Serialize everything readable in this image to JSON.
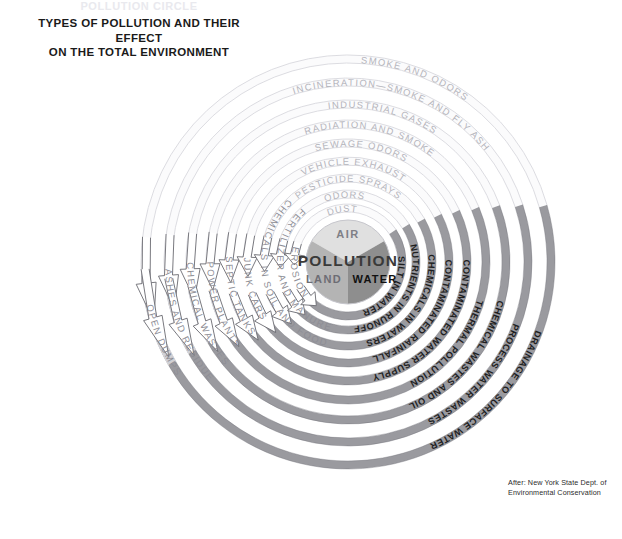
{
  "title": {
    "supertitle": "POLLUTION CIRCLE",
    "line1": "TYPES OF POLLUTION AND THEIR EFFECT",
    "line2": "ON THE TOTAL ENVIRONMENT"
  },
  "credit": {
    "line1": "After: New York State Dept. of",
    "line2": "Environmental Conservation"
  },
  "core": {
    "center_label": "POLLUTION",
    "air": "AIR",
    "land": "LAND",
    "water": "WATER",
    "air_color": "#e0e0e0",
    "land_color": "#b4b4b4",
    "water_color": "#8e8e8e"
  },
  "colors": {
    "ring_light_fill": "#fbfbfc",
    "ring_light_stroke": "#d8d8de",
    "ring_mid_fill": "#d0d0d4",
    "ring_dark_fill": "#9a9a9f",
    "ring_dark_stroke": "#6f6f75",
    "arrow_stroke": "#6a6a70",
    "arrow_fill": "#ffffff",
    "background": "#ffffff"
  },
  "diagram": {
    "center_x": 348,
    "center_y": 262,
    "core_radius": 42,
    "type": "concentric-ring-cycle",
    "rings_air": [
      {
        "index": 1,
        "label": "DUST",
        "radius": 54,
        "tone": "light"
      },
      {
        "index": 2,
        "label": "ODORS",
        "radius": 68,
        "tone": "light"
      },
      {
        "index": 3,
        "label": "PESTICIDE SPRAYS",
        "radius": 84,
        "tone": "light"
      },
      {
        "index": 4,
        "label": "VEHICLE EXHAUST",
        "radius": 101,
        "tone": "light"
      },
      {
        "index": 5,
        "label": "SEWAGE ODORS",
        "radius": 119,
        "tone": "light"
      },
      {
        "index": 6,
        "label": "RADIATION AND SMOKE",
        "radius": 138,
        "tone": "light"
      },
      {
        "index": 7,
        "label": "INDUSTRIAL GASES",
        "radius": 158,
        "tone": "light"
      },
      {
        "index": 8,
        "label": "INCINERATION—SMOKE AND FLY ASH",
        "radius": 180,
        "tone": "light"
      },
      {
        "index": 9,
        "label": "SMOKE AND ODORS",
        "radius": 203,
        "tone": "light"
      }
    ],
    "rings_land": [
      {
        "index": 1,
        "label": "EROSION",
        "radius": 54,
        "tone": "mid"
      },
      {
        "index": 2,
        "label": "FERTILIZER AND MANURE",
        "radius": 68,
        "tone": "mid"
      },
      {
        "index": 3,
        "label": "CHEMICALS IN SOIL AND FOOD",
        "radius": 84,
        "tone": "mid"
      },
      {
        "index": 4,
        "label": "JUNK CARS",
        "radius": 101,
        "tone": "mid"
      },
      {
        "index": 5,
        "label": "SEPTIC TANKS",
        "radius": 119,
        "tone": "mid"
      },
      {
        "index": 6,
        "label": "POWER PLANTS",
        "radius": 138,
        "tone": "mid"
      },
      {
        "index": 7,
        "label": "CHEMICAL WASTES",
        "radius": 158,
        "tone": "mid"
      },
      {
        "index": 8,
        "label": "ASHES AND RESIDUE",
        "radius": 180,
        "tone": "mid"
      },
      {
        "index": 9,
        "label": "OPEN DUMPS",
        "radius": 203,
        "tone": "mid"
      }
    ],
    "rings_water": [
      {
        "index": 1,
        "label": "SILT IN WATER",
        "radius": 54,
        "tone": "dark"
      },
      {
        "index": 2,
        "label": "NUTRIENTS IN RUNOFF",
        "radius": 68,
        "tone": "dark"
      },
      {
        "index": 3,
        "label": "CHEMICALS IN WATERS",
        "radius": 84,
        "tone": "dark"
      },
      {
        "index": 4,
        "label": "CONTAMINATED RAINFALL",
        "radius": 101,
        "tone": "dark"
      },
      {
        "index": 5,
        "label": "CONTAMINATED WATER SUPPLY",
        "radius": 119,
        "tone": "dark"
      },
      {
        "index": 6,
        "label": "THERMAL POLLUTION",
        "radius": 138,
        "tone": "dark"
      },
      {
        "index": 7,
        "label": "CHEMICAL WASTES AND OIL",
        "radius": 158,
        "tone": "dark"
      },
      {
        "index": 8,
        "label": "PROCESS WATER WASTES",
        "radius": 180,
        "tone": "dark"
      },
      {
        "index": 9,
        "label": "DRAINAGE TO SURFACE WATER",
        "radius": 203,
        "tone": "dark"
      }
    ]
  }
}
